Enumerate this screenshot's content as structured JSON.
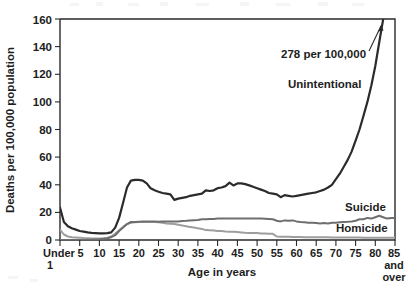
{
  "figure": {
    "title_partial": "",
    "caption": ""
  },
  "chart_data": {
    "type": "line",
    "title": "",
    "xlabel": "Age in years",
    "ylabel": "Deaths per 100,000 population",
    "xlim": [
      0,
      85
    ],
    "ylim": [
      0,
      160
    ],
    "grid": false,
    "legend_position": "inline-right",
    "y_ticks": [
      0,
      20,
      40,
      60,
      80,
      100,
      120,
      140,
      160
    ],
    "y_tick_labels": [
      "0",
      "20",
      "40",
      "60",
      "80",
      "100",
      "120",
      "140",
      "160"
    ],
    "x_ticks": [
      0,
      5,
      10,
      15,
      20,
      25,
      30,
      35,
      40,
      45,
      50,
      55,
      60,
      65,
      70,
      75,
      80,
      85
    ],
    "x_tick_labels": [
      "Under\n1",
      "5",
      "10",
      "15",
      "20",
      "25",
      "30",
      "35",
      "40",
      "45",
      "50",
      "55",
      "60",
      "65",
      "70",
      "75",
      "80",
      "85\nand\nover"
    ],
    "x_first_label_line1": "Under",
    "x_first_label_line2": "1",
    "x_last_label_line1": "85",
    "x_last_label_line2": "and",
    "x_last_label_line3": "over",
    "annotations": [
      {
        "text": "278 per 100,000",
        "x": 82,
        "y": 145,
        "points_to_series": "Unintentional",
        "arrow": "up-right"
      }
    ],
    "series": [
      {
        "name": "Unintentional",
        "color": "#2b2b2b",
        "width": 2.2,
        "label_x": 69,
        "label_y": 103,
        "x": [
          0,
          1,
          2,
          3,
          4,
          5,
          6,
          7,
          8,
          9,
          10,
          11,
          12,
          13,
          14,
          15,
          16,
          17,
          18,
          19,
          20,
          21,
          22,
          23,
          24,
          25,
          26,
          27,
          28,
          29,
          30,
          31,
          32,
          33,
          34,
          35,
          36,
          37,
          38,
          39,
          40,
          41,
          42,
          43,
          44,
          45,
          46,
          47,
          48,
          49,
          50,
          51,
          52,
          53,
          54,
          55,
          56,
          57,
          58,
          59,
          60,
          61,
          62,
          63,
          64,
          65,
          66,
          67,
          68,
          69,
          70,
          71,
          72,
          73,
          74,
          75,
          76,
          77,
          78,
          79,
          80,
          81,
          82,
          83,
          84,
          85
        ],
        "values": [
          23.5,
          13.0,
          10.0,
          8.5,
          7.5,
          6.5,
          6.0,
          5.5,
          5.2,
          5.0,
          4.8,
          4.8,
          5.0,
          5.5,
          9.0,
          16.0,
          27.0,
          38.0,
          43.0,
          43.5,
          43.5,
          43.0,
          41.0,
          37.5,
          36.0,
          35.0,
          34.0,
          33.5,
          33.0,
          29.0,
          30.0,
          30.5,
          31.0,
          32.0,
          32.5,
          33.0,
          33.5,
          36.0,
          35.5,
          36.0,
          37.5,
          38.0,
          39.0,
          41.5,
          39.5,
          41.0,
          41.0,
          40.5,
          39.5,
          38.5,
          37.5,
          36.5,
          35.5,
          34.0,
          33.5,
          33.0,
          31.0,
          32.5,
          32.0,
          31.5,
          32.0,
          32.5,
          33.0,
          33.5,
          34.0,
          34.5,
          35.5,
          36.5,
          38.0,
          40.0,
          44.0,
          48.0,
          53.0,
          58.0,
          64.0,
          72.0,
          80.0,
          90.0,
          100.0,
          112.0,
          126.0,
          143.0,
          160.0,
          196.0,
          236.0,
          278.0
        ],
        "endpoint_value": 278,
        "endpoint_note": "278 per 100,000"
      },
      {
        "name": "Suicide",
        "color": "#6e6e6e",
        "width": 2.0,
        "label_x": 79,
        "label_y": 23,
        "x": [
          0,
          1,
          2,
          3,
          4,
          5,
          6,
          7,
          8,
          9,
          10,
          11,
          12,
          13,
          14,
          15,
          16,
          17,
          18,
          19,
          20,
          21,
          22,
          23,
          24,
          25,
          26,
          27,
          28,
          29,
          30,
          31,
          32,
          33,
          34,
          35,
          36,
          37,
          38,
          39,
          40,
          41,
          42,
          43,
          44,
          45,
          46,
          47,
          48,
          49,
          50,
          51,
          52,
          53,
          54,
          55,
          56,
          57,
          58,
          59,
          60,
          61,
          62,
          63,
          64,
          65,
          66,
          67,
          68,
          69,
          70,
          71,
          72,
          73,
          74,
          75,
          76,
          77,
          78,
          79,
          80,
          81,
          82,
          83,
          84,
          85
        ],
        "values": [
          0.0,
          0.0,
          0.0,
          0.0,
          0.0,
          0.0,
          0.1,
          0.2,
          0.3,
          0.4,
          0.6,
          0.9,
          1.3,
          2.0,
          3.5,
          6.5,
          9.0,
          11.5,
          13.0,
          13.0,
          13.2,
          13.3,
          13.5,
          13.5,
          13.3,
          13.2,
          13.3,
          13.3,
          13.3,
          13.5,
          13.5,
          13.8,
          14.0,
          14.2,
          14.3,
          14.5,
          15.0,
          15.0,
          15.3,
          15.3,
          15.5,
          15.5,
          15.5,
          15.5,
          15.5,
          15.6,
          15.5,
          15.5,
          15.5,
          15.5,
          15.5,
          15.5,
          15.4,
          15.2,
          15.0,
          14.0,
          13.5,
          14.2,
          14.0,
          14.2,
          13.5,
          13.0,
          12.8,
          12.5,
          12.5,
          12.3,
          12.0,
          12.2,
          12.0,
          12.5,
          12.5,
          12.8,
          13.0,
          13.2,
          13.5,
          14.0,
          15.0,
          15.0,
          16.0,
          15.5,
          16.5,
          17.5,
          16.5,
          15.5,
          16.0,
          16.0
        ]
      },
      {
        "name": "Homicide",
        "color": "#9e9e9e",
        "width": 2.0,
        "label_x": 79,
        "label_y": 10,
        "x": [
          0,
          1,
          2,
          3,
          4,
          5,
          6,
          7,
          8,
          9,
          10,
          11,
          12,
          13,
          14,
          15,
          16,
          17,
          18,
          19,
          20,
          21,
          22,
          23,
          24,
          25,
          26,
          27,
          28,
          29,
          30,
          31,
          32,
          33,
          34,
          35,
          36,
          37,
          38,
          39,
          40,
          41,
          42,
          43,
          44,
          45,
          46,
          47,
          48,
          49,
          50,
          51,
          52,
          53,
          54,
          55,
          56,
          57,
          58,
          59,
          60,
          61,
          62,
          63,
          64,
          65,
          66,
          67,
          68,
          69,
          70,
          71,
          72,
          73,
          74,
          75,
          76,
          77,
          78,
          79,
          80,
          81,
          82,
          83,
          84,
          85
        ],
        "values": [
          7.5,
          4.0,
          2.5,
          2.0,
          1.8,
          1.6,
          1.4,
          1.2,
          1.1,
          1.0,
          1.0,
          1.2,
          1.5,
          2.5,
          4.5,
          7.0,
          9.5,
          11.5,
          12.5,
          12.8,
          13.0,
          13.0,
          13.0,
          13.0,
          13.0,
          12.8,
          12.5,
          12.0,
          11.8,
          11.5,
          11.0,
          10.5,
          10.0,
          9.5,
          9.0,
          8.5,
          8.0,
          7.2,
          7.0,
          6.8,
          6.5,
          6.5,
          6.2,
          6.0,
          6.0,
          5.8,
          5.5,
          5.2,
          5.0,
          5.0,
          5.0,
          4.8,
          4.6,
          4.5,
          4.5,
          2.5,
          2.4,
          2.4,
          2.3,
          2.2,
          2.2,
          2.1,
          2.0,
          2.0,
          2.0,
          2.0,
          2.0,
          2.0,
          2.0,
          1.9,
          1.9,
          1.8,
          1.8,
          1.8,
          1.8,
          1.8,
          1.8,
          1.7,
          1.7,
          1.7,
          1.7,
          1.6,
          1.6,
          1.6,
          1.6,
          1.6
        ]
      }
    ]
  },
  "colors": {
    "unintentional": "#2b2b2b",
    "suicide": "#6e6e6e",
    "homicide": "#9e9e9e",
    "axis": "#2a2a2a",
    "background": "#ffffff"
  }
}
